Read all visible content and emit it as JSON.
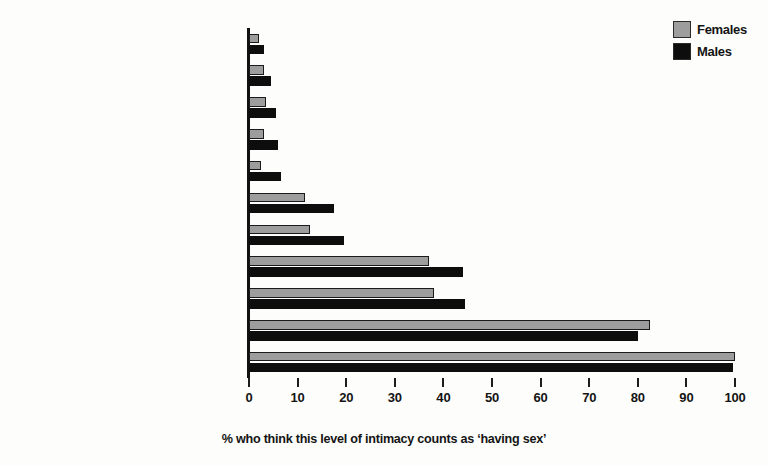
{
  "chart_data": {
    "type": "bar",
    "orientation": "horizontal",
    "title": "",
    "xlabel": "% who think this level of intimacy counts as ‘having sex’",
    "ylabel": "",
    "xlim": [
      0,
      100
    ],
    "xticks": [
      0,
      10,
      20,
      30,
      40,
      50,
      60,
      70,
      80,
      90,
      100
    ],
    "grid": false,
    "legend_position": "top-right",
    "categories": [
      "Deep kissing",
      "Oral contact on your breasts/nipples",
      "Person touches your breasts/nipples",
      "You touch other’s breasts/nipples",
      "Oral contact on other’s breasts/nipples",
      "You touch other’s genitals",
      "Person touches other’s genitals",
      "Oral contact with other’s genitals",
      "Oral contact with your genitals",
      "Penile-anal intercourse",
      "Penile-vaginal intercourse"
    ],
    "series": [
      {
        "name": "Females",
        "color": "#9d9d9d",
        "values": [
          2,
          3,
          3.5,
          3,
          2.5,
          11.5,
          12.5,
          37,
          38,
          82.5,
          100
        ]
      },
      {
        "name": "Males",
        "color": "#0d0d0d",
        "values": [
          3,
          4.5,
          5.5,
          6,
          6.5,
          17.5,
          19.5,
          44,
          44.5,
          80,
          99.5
        ]
      }
    ]
  },
  "legend": {
    "items": [
      {
        "label": "Females",
        "color": "#9d9d9d"
      },
      {
        "label": "Males",
        "color": "#0d0d0d"
      }
    ]
  },
  "axis": {
    "x_title": "% who think this level of intimacy counts as ‘having sex’",
    "tick_labels": [
      "0",
      "10",
      "20",
      "30",
      "40",
      "50",
      "60",
      "70",
      "80",
      "90",
      "100"
    ]
  }
}
